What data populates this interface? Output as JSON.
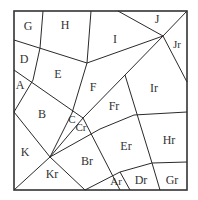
{
  "diagram": {
    "type": "polygonal subdivision of a square",
    "frame": {
      "x": 14,
      "y": 11,
      "width": 173,
      "height": 179
    },
    "regions": [
      {
        "id": "G",
        "label": "G",
        "x": 28,
        "y": 27
      },
      {
        "id": "H",
        "label": "H",
        "x": 65,
        "y": 26
      },
      {
        "id": "I",
        "label": "I",
        "x": 115,
        "y": 40
      },
      {
        "id": "J",
        "label": "J",
        "x": 157,
        "y": 20
      },
      {
        "id": "Jr",
        "label": "Jr",
        "x": 177,
        "y": 45
      },
      {
        "id": "D",
        "label": "D",
        "x": 24,
        "y": 60
      },
      {
        "id": "E",
        "label": "E",
        "x": 58,
        "y": 75
      },
      {
        "id": "F",
        "label": "F",
        "x": 93,
        "y": 88
      },
      {
        "id": "Ir",
        "label": "Ir",
        "x": 154,
        "y": 89
      },
      {
        "id": "A",
        "label": "A",
        "x": 20,
        "y": 86
      },
      {
        "id": "B",
        "label": "B",
        "x": 42,
        "y": 115
      },
      {
        "id": "C",
        "label": "C",
        "x": 72,
        "y": 120
      },
      {
        "id": "Cr",
        "label": "Cr",
        "x": 81,
        "y": 128
      },
      {
        "id": "Fr",
        "label": "Fr",
        "x": 114,
        "y": 107
      },
      {
        "id": "Hr",
        "label": "Hr",
        "x": 169,
        "y": 141
      },
      {
        "id": "Er",
        "label": "Er",
        "x": 126,
        "y": 147
      },
      {
        "id": "K",
        "label": "K",
        "x": 25,
        "y": 153
      },
      {
        "id": "Br",
        "label": "Br",
        "x": 87,
        "y": 162
      },
      {
        "id": "Kr",
        "label": "Kr",
        "x": 52,
        "y": 175
      },
      {
        "id": "Ar",
        "label": "Ar",
        "x": 116,
        "y": 182
      },
      {
        "id": "Dr",
        "label": "Dr",
        "x": 141,
        "y": 181
      },
      {
        "id": "Gr",
        "label": "Gr",
        "x": 172,
        "y": 181
      }
    ],
    "colors": {
      "line": "#2a2a2a",
      "text": "#333333",
      "background": "#ffffff"
    }
  }
}
